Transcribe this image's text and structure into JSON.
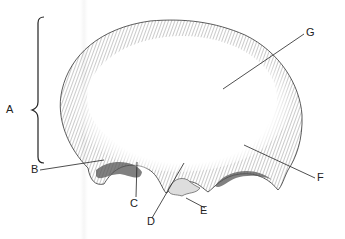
{
  "figure": {
    "colors": {
      "ink": "#2a2a2a",
      "hatch": "#555555",
      "background": "#ffffff"
    },
    "labels": [
      {
        "id": "A",
        "text": "A",
        "x": 6,
        "y": 108,
        "points_to": "bracket spanning squamous part"
      },
      {
        "id": "B",
        "text": "B",
        "x": 32,
        "y": 166,
        "points_to": "left supraorbital margin"
      },
      {
        "id": "C",
        "text": "C",
        "x": 130,
        "y": 200,
        "points_to": "left orbital rim notch"
      },
      {
        "id": "D",
        "text": "D",
        "x": 147,
        "y": 219,
        "points_to": "glabella / nasal region"
      },
      {
        "id": "E",
        "text": "E",
        "x": 200,
        "y": 210,
        "points_to": "nasal notch"
      },
      {
        "id": "F",
        "text": "F",
        "x": 318,
        "y": 176,
        "points_to": "right supraorbital margin"
      },
      {
        "id": "G",
        "text": "G",
        "x": 307,
        "y": 30,
        "points_to": "frontal squama surface"
      }
    ]
  }
}
